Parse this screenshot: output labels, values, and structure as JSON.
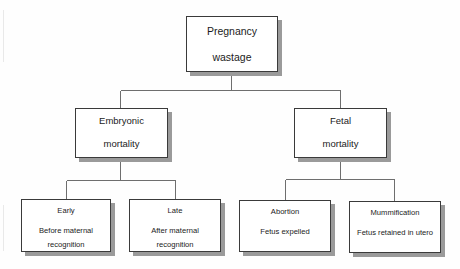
{
  "diagram": {
    "type": "tree",
    "background_color": "#fefefe",
    "box_fill": "#ffffff",
    "box_border_color": "#3a3a3a",
    "box_shadow_color": "#9a9a9a",
    "connector_color": "#6e6e6e",
    "text_color": "#1b1b1b"
  },
  "nodes": {
    "root": {
      "line1": "Pregnancy",
      "line2": "wastage"
    },
    "level2": [
      {
        "id": "embryonic-mortality",
        "line1": "Embryonic",
        "line2": "mortality"
      },
      {
        "id": "fetal-mortality",
        "line1": "Fetal",
        "line2": "mortality"
      }
    ],
    "leaves": [
      {
        "id": "early",
        "title": "Early",
        "desc_line1": "Before maternal",
        "desc_line2": "recognition"
      },
      {
        "id": "late",
        "title": "Late",
        "desc_line1": "After maternal",
        "desc_line2": "recognition"
      },
      {
        "id": "abortion",
        "title": "Abortion",
        "desc_line1": "Fetus expelled",
        "desc_line2": ""
      },
      {
        "id": "mummification",
        "title": "Mummification",
        "desc_line1": "Fetus retained in utero",
        "desc_line2": ""
      }
    ]
  }
}
